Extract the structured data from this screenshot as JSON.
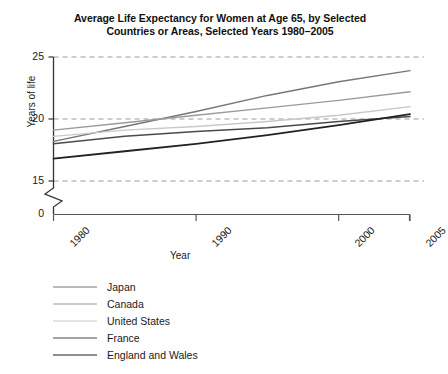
{
  "chart_data": {
    "type": "line",
    "title": "Average Life Expectancy for Women at Age 65, by Selected Countries or Areas, Selected Years 1980–2005",
    "title_line1": "Average Life Expectancy for Women at Age 65, by Selected",
    "title_line2": "Countries or Areas, Selected Years 1980–2005",
    "xlabel": "Year",
    "ylabel": "Years of life",
    "xlim": [
      1980,
      2005
    ],
    "ylim": [
      15,
      25
    ],
    "y_axis_break": true,
    "y_break_label": "0",
    "grid": true,
    "grid_style": "dashed-horizontal",
    "legend_position": "below-left",
    "xticks": [
      "1980",
      "1990",
      "2000",
      "2005"
    ],
    "xtick_values": [
      1980,
      1990,
      2000,
      2005
    ],
    "yticks": [
      "15",
      "20",
      "25"
    ],
    "ytick_values": [
      15,
      20,
      25
    ],
    "x": [
      1980,
      1985,
      1990,
      1995,
      2000,
      2005
    ],
    "series": [
      {
        "name": "Japan",
        "color": "#777777",
        "width": 1.4,
        "values": [
          18.2,
          19.4,
          20.6,
          21.9,
          23.0,
          23.9
        ]
      },
      {
        "name": "Canada",
        "color": "#9a9a9a",
        "width": 1.4,
        "values": [
          19.1,
          19.7,
          20.3,
          20.9,
          21.5,
          22.2
        ]
      },
      {
        "name": "United States",
        "color": "#c8c8c8",
        "width": 1.4,
        "values": [
          18.6,
          19.1,
          19.4,
          19.8,
          20.3,
          21.0
        ]
      },
      {
        "name": "France",
        "color": "#4a4a4a",
        "width": 1.5,
        "values": [
          18.0,
          18.6,
          19.0,
          19.3,
          19.8,
          20.2
        ]
      },
      {
        "name": "England and Wales",
        "color": "#222222",
        "width": 1.8,
        "values": [
          16.8,
          17.4,
          18.0,
          18.7,
          19.5,
          20.4
        ]
      }
    ]
  }
}
